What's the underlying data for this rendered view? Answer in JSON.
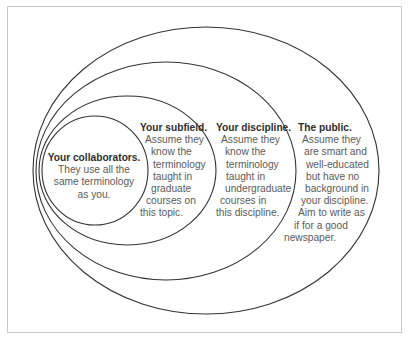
{
  "diagram": {
    "type": "nested-ellipses",
    "stroke_color": "#333333",
    "frame_border_color": "#c8c8c8",
    "audiences": [
      {
        "id": "collaborators",
        "title": "Your collaborators.",
        "lines": [
          "They use all the",
          "same terminology",
          "as you."
        ]
      },
      {
        "id": "subfield",
        "title": "Your subfield.",
        "lines": [
          "Assume they",
          "know the",
          "terminology",
          "taught in",
          "graduate",
          "courses on",
          "this topic."
        ]
      },
      {
        "id": "discipline",
        "title": "Your discipline.",
        "lines": [
          "Assume they",
          "know the",
          "terminology",
          "taught in",
          "undergraduate",
          "courses in",
          "this discipline."
        ]
      },
      {
        "id": "public",
        "title": "The public.",
        "lines": [
          "Assume they",
          "are smart and",
          "well-educated",
          "but have no",
          "background in",
          "your discipline.",
          "Aim to write as",
          "if for a good",
          "newspaper."
        ]
      }
    ]
  }
}
